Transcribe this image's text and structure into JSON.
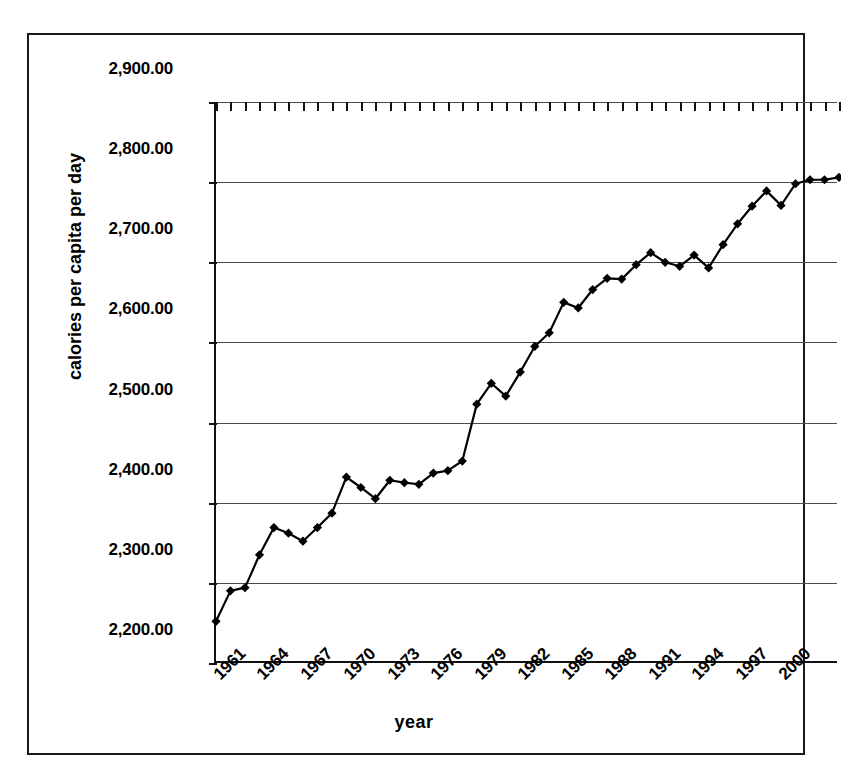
{
  "chart_data": {
    "type": "line",
    "title": "",
    "xlabel": "year",
    "ylabel": "calories per capita per day",
    "xlim": [
      1961,
      2004
    ],
    "ylim": [
      2200,
      2900
    ],
    "grid": true,
    "legend": "none",
    "marker": "diamond",
    "line_color": "#000000",
    "marker_color": "#000000",
    "y_tick_labels": [
      "2,900.00",
      "2,800.00",
      "2,700.00",
      "2,600.00",
      "2,500.00",
      "2,400.00",
      "2,300.00",
      "2,200.00"
    ],
    "y_tick_values": [
      2900,
      2800,
      2700,
      2600,
      2500,
      2400,
      2300,
      2200
    ],
    "x_tick_labels": [
      "1961",
      "1964",
      "1967",
      "1970",
      "1973",
      "1976",
      "1979",
      "1982",
      "1985",
      "1988",
      "1991",
      "1994",
      "1997",
      "2000"
    ],
    "x_tick_values": [
      1961,
      1964,
      1967,
      1970,
      1973,
      1976,
      1979,
      1982,
      1985,
      1988,
      1991,
      1994,
      1997,
      2000
    ],
    "x": [
      1961,
      1962,
      1963,
      1964,
      1965,
      1966,
      1967,
      1968,
      1969,
      1970,
      1971,
      1972,
      1973,
      1974,
      1975,
      1976,
      1977,
      1978,
      1979,
      1980,
      1981,
      1982,
      1983,
      1984,
      1985,
      1986,
      1987,
      1988,
      1989,
      1990,
      1991,
      1992,
      1993,
      1994,
      1995,
      1996,
      1997,
      1998,
      1999,
      2000,
      2001,
      2002,
      2003,
      2004
    ],
    "values": [
      2252,
      2290,
      2294,
      2335,
      2369,
      2362,
      2352,
      2369,
      2387,
      2432,
      2419,
      2405,
      2428,
      2425,
      2423,
      2437,
      2440,
      2452,
      2523,
      2549,
      2533,
      2563,
      2595,
      2612,
      2650,
      2643,
      2666,
      2680,
      2679,
      2697,
      2712,
      2700,
      2695,
      2709,
      2693,
      2722,
      2748,
      2770,
      2789,
      2771,
      2798,
      2803,
      2803,
      2806
    ],
    "series": [
      {
        "name": "calories per capita per day",
        "values": [
          2252,
          2290,
          2294,
          2335,
          2369,
          2362,
          2352,
          2369,
          2387,
          2432,
          2419,
          2405,
          2428,
          2425,
          2423,
          2437,
          2440,
          2452,
          2523,
          2549,
          2533,
          2563,
          2595,
          2612,
          2650,
          2643,
          2666,
          2680,
          2679,
          2697,
          2712,
          2700,
          2695,
          2709,
          2693,
          2722,
          2748,
          2770,
          2789,
          2771,
          2798,
          2803,
          2803,
          2806
        ]
      }
    ]
  }
}
